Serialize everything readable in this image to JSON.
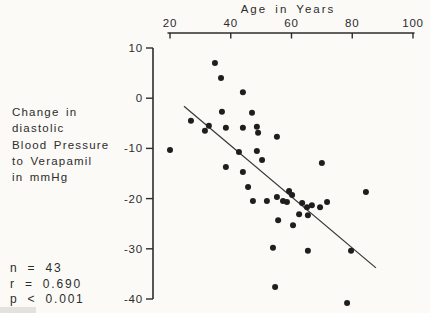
{
  "figure": {
    "background": "#fbfaf7",
    "ink_color": "#2c2c2c",
    "marker_color": "#1e1e1e"
  },
  "chart_data": {
    "type": "scatter",
    "title": "",
    "xlabel": "Age in Years",
    "ylabel": "Change in diastolic Blood Pressure to Verapamil in mmHg",
    "x_axis": {
      "side": "top",
      "range": [
        20,
        100
      ],
      "ticks": [
        20,
        40,
        60,
        80,
        100
      ]
    },
    "y_axis": {
      "side": "left",
      "range": [
        -42,
        10
      ],
      "ticks": [
        10,
        0,
        -10,
        -20,
        -30,
        -40
      ],
      "label_lines": [
        "Change in",
        "diastolic",
        "Blood Pressure",
        "to Verapamil",
        "in mmHg"
      ]
    },
    "grid": false,
    "legend": null,
    "points": [
      [
        34.8,
        7.0
      ],
      [
        36.8,
        4.0
      ],
      [
        44.0,
        1.2
      ],
      [
        37.1,
        -2.7
      ],
      [
        47.0,
        -2.9
      ],
      [
        26.9,
        -4.5
      ],
      [
        32.8,
        -5.5
      ],
      [
        31.5,
        -6.5
      ],
      [
        38.4,
        -5.9
      ],
      [
        44.0,
        -5.9
      ],
      [
        48.6,
        -5.7
      ],
      [
        49.0,
        -6.9
      ],
      [
        55.2,
        -7.7
      ],
      [
        20.0,
        -10.3
      ],
      [
        42.7,
        -10.7
      ],
      [
        48.6,
        -10.5
      ],
      [
        50.3,
        -12.3
      ],
      [
        38.4,
        -13.7
      ],
      [
        44.0,
        -14.7
      ],
      [
        70.0,
        -12.9
      ],
      [
        45.7,
        -17.7
      ],
      [
        47.3,
        -20.5
      ],
      [
        51.9,
        -20.5
      ],
      [
        55.2,
        -19.7
      ],
      [
        59.2,
        -18.5
      ],
      [
        60.2,
        -19.3
      ],
      [
        57.2,
        -20.5
      ],
      [
        58.5,
        -20.7
      ],
      [
        63.5,
        -20.9
      ],
      [
        65.1,
        -21.7
      ],
      [
        66.7,
        -21.3
      ],
      [
        69.4,
        -21.7
      ],
      [
        71.7,
        -20.7
      ],
      [
        62.5,
        -23.1
      ],
      [
        65.4,
        -23.3
      ],
      [
        55.6,
        -24.3
      ],
      [
        60.5,
        -25.3
      ],
      [
        53.9,
        -29.8
      ],
      [
        65.4,
        -30.4
      ],
      [
        79.6,
        -30.4
      ],
      [
        54.6,
        -37.6
      ],
      [
        78.3,
        -40.8
      ],
      [
        84.5,
        -18.7
      ]
    ],
    "regression_line": {
      "x1": 24.6,
      "y1": -1.6,
      "x2": 87.8,
      "y2": -33.8
    },
    "stats": [
      "n = 43",
      "r = 0.690",
      "p < 0.001"
    ]
  }
}
